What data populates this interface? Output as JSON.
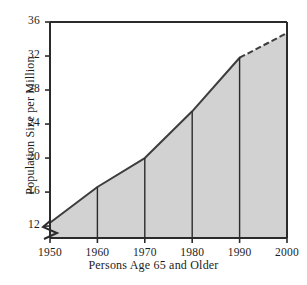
{
  "chart_data": {
    "type": "area",
    "title": "",
    "subtitle": "",
    "xlabel": "Persons Age 65 and Older",
    "ylabel": "Population Size per Million",
    "x": [
      1950,
      1960,
      1970,
      1980,
      1990,
      2000
    ],
    "values": [
      12.4,
      16.6,
      20.0,
      25.5,
      31.8,
      34.7
    ],
    "series": [
      {
        "name": "Population Size per Million",
        "values": [
          12.4,
          16.6,
          20.0,
          25.5,
          31.8,
          34.7
        ]
      }
    ],
    "xtick_labels": [
      "1950",
      "1960",
      "1970",
      "1980",
      "1990",
      "2000"
    ],
    "ytick_labels": [
      "12",
      "16",
      "20",
      "24",
      "28",
      "32",
      "36"
    ],
    "ytick_values": [
      12,
      16,
      20,
      24,
      28,
      32,
      36
    ],
    "xlim": [
      1950,
      2000
    ],
    "ylim": [
      10.6,
      36
    ],
    "grid": false,
    "legend": "none",
    "y_axis_break": true,
    "y_axis_break_note": "zigzag break on y-axis below 12",
    "projected_from": 1990,
    "projected_note": "segment from 1990 to 2000 drawn dashed (projection)",
    "fill_color": "#d2d2d2",
    "line_color": "#3d3d3d",
    "axis_color": "#2b2b2b",
    "background_color": "#ffffff"
  }
}
